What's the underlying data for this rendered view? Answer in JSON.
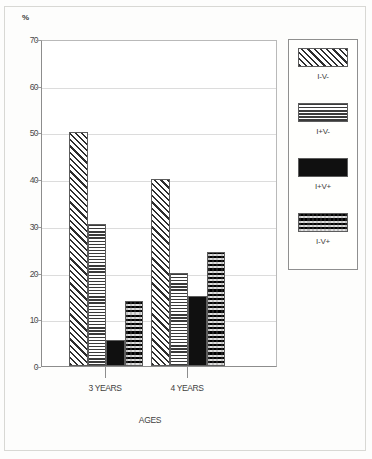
{
  "chart_data": {
    "type": "bar",
    "title": "",
    "subtitle": "",
    "xlabel": "AGES",
    "ylabel": "%",
    "y_unit_symbol": "%",
    "categories": [
      "3 YEARS",
      "4 YEARS"
    ],
    "series": [
      {
        "name": "I-V-",
        "pattern": "diagonal-hatch",
        "values": [
          50,
          40
        ]
      },
      {
        "name": "I+V-",
        "pattern": "horizontal-lines",
        "values": [
          30.5,
          20
        ]
      },
      {
        "name": "I+V+",
        "pattern": "solid-black",
        "values": [
          5.5,
          15
        ]
      },
      {
        "name": "I-V+",
        "pattern": "checkerboard",
        "values": [
          14,
          24.5
        ]
      }
    ],
    "ylim": [
      0,
      70
    ],
    "yticks": [
      0,
      10,
      20,
      30,
      40,
      50,
      60,
      70
    ],
    "ytick_labels": [
      "0",
      "10",
      "20",
      "30",
      "40",
      "50",
      "60",
      "70"
    ],
    "grid": true,
    "grid_axis": "y",
    "legend_position": "right",
    "legend_entries": [
      "I-V-",
      "I+V-",
      "I+V+",
      "I-V+"
    ],
    "colors": {
      "ink": "#2e2e2e",
      "axis": "#8d8d8d",
      "grid": "#dcdcdc",
      "background": "#ffffff",
      "solid_series": "#101010"
    }
  }
}
